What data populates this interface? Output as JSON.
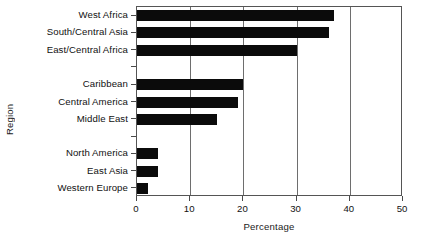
{
  "chart_data": {
    "type": "bar",
    "orientation": "horizontal",
    "title": "",
    "xlabel": "Percentage",
    "ylabel": "Region",
    "xlim": [
      0,
      50
    ],
    "xticks": [
      0,
      10,
      20,
      30,
      40,
      50
    ],
    "grid": "vertical gridlines at 10, 20, 30, 40",
    "legend": "none",
    "bar_color": "#0b0b0b",
    "categories": [
      "West Africa",
      "South/Central Asia",
      "East/Central Africa",
      "",
      "Caribbean",
      "Central America",
      "Middle East",
      "",
      "North America",
      "East Asia",
      "Western Europe"
    ],
    "values": [
      37,
      36,
      30,
      null,
      20,
      19,
      15,
      null,
      4,
      4,
      2
    ],
    "groups": [
      {
        "items": [
          {
            "label": "West Africa",
            "value": 37
          },
          {
            "label": "South/Central Asia",
            "value": 36
          },
          {
            "label": "East/Central Africa",
            "value": 30
          }
        ]
      },
      {
        "items": [
          {
            "label": "Caribbean",
            "value": 20
          },
          {
            "label": "Central America",
            "value": 19
          },
          {
            "label": "Middle East",
            "value": 15
          }
        ]
      },
      {
        "items": [
          {
            "label": "North America",
            "value": 4
          },
          {
            "label": "East Asia",
            "value": 4
          },
          {
            "label": "Western Europe",
            "value": 2
          }
        ]
      }
    ]
  },
  "axes": {
    "ylabel": "Region",
    "xlabel": "Percentage",
    "xticks": [
      "0",
      "10",
      "20",
      "30",
      "40",
      "50"
    ]
  }
}
